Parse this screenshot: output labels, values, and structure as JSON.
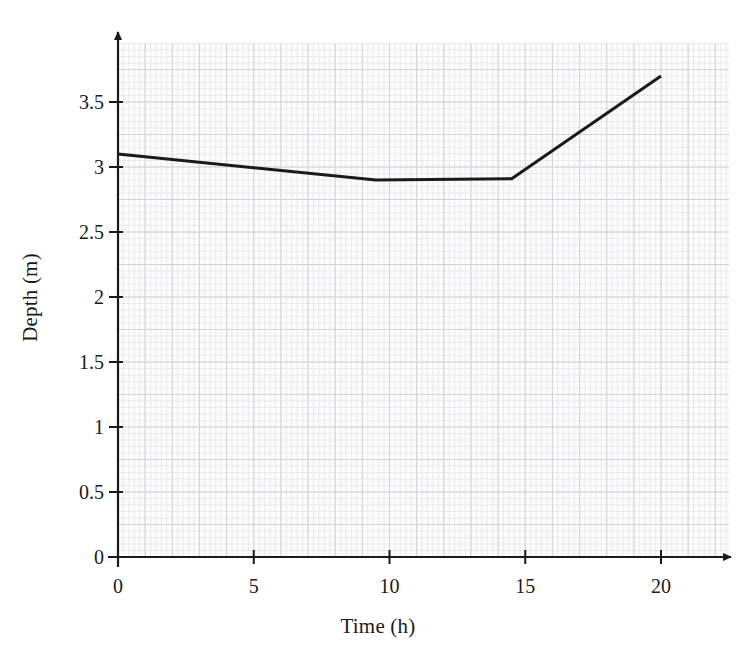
{
  "chart_data": {
    "type": "line",
    "title": "",
    "xlabel": "Time (h)",
    "ylabel": "Depth (m)",
    "xlim": [
      0,
      22.5
    ],
    "ylim": [
      0,
      3.95
    ],
    "xticks": [
      0,
      5,
      10,
      15,
      20
    ],
    "xtick_labels": [
      "0",
      "5",
      "10",
      "15",
      "20"
    ],
    "yticks": [
      0,
      0.5,
      1,
      1.5,
      2,
      2.5,
      3,
      3.5
    ],
    "ytick_labels": [
      "0",
      "0.5",
      "1",
      "1.5",
      "2",
      "2.5",
      "3",
      "3.5"
    ],
    "grid": "graph-paper",
    "grid_minor_step_x": 0.2,
    "grid_minor_step_y": 0.05,
    "grid_major_step_x": 1,
    "grid_major_step_y": 0.25,
    "legend": null,
    "axis_arrows": true,
    "series": [
      {
        "name": "Depth",
        "color": "#1a1a1a",
        "line_width": 3,
        "x": [
          0,
          9.5,
          14.5,
          20
        ],
        "y": [
          3.1,
          2.9,
          2.91,
          3.7
        ]
      }
    ],
    "annotations": []
  },
  "colors": {
    "line": "#1a1a1a",
    "axis": "#1a1a1a",
    "grid_minor": "#e3e3ea",
    "grid_major": "#cfcfd8",
    "background": "#ffffff",
    "plot_background": "#fcfcfd",
    "text": "#1a1a1a"
  },
  "geometry": {
    "origin_x": 118,
    "origin_y": 557,
    "px_per_x": 27.15,
    "px_per_y": 130,
    "plot_right": 712,
    "plot_top": 42
  }
}
